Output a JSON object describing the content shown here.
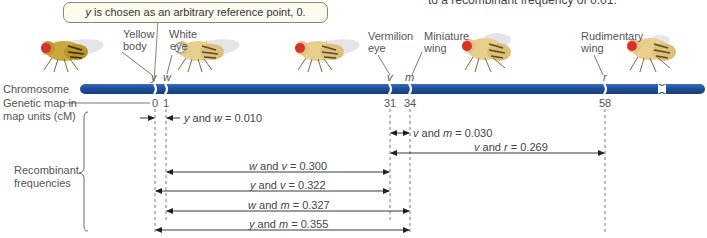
{
  "top_note": "to a recombinant frequency of 0.01.",
  "callout": {
    "gene": "y",
    "text": " is chosen as an arbitrary reference point, 0."
  },
  "row_labels": {
    "chromosome": "Chromosome",
    "genetic_map_line1": "Genetic map in",
    "genetic_map_line2": "map units (cM)",
    "recombinant_line1": "Recombinant",
    "recombinant_line2": "frequencies"
  },
  "genes": [
    {
      "symbol": "y",
      "name_line1": "Yellow",
      "name_line2": "body",
      "map_units": "0",
      "x": 155
    },
    {
      "symbol": "w",
      "name_line1": "White",
      "name_line2": "eye",
      "map_units": "1",
      "x": 166
    },
    {
      "symbol": "v",
      "name_line1": "Vermilion",
      "name_line2": "eye",
      "map_units": "31",
      "x": 390
    },
    {
      "symbol": "m",
      "name_line1": "Miniature",
      "name_line2": "wing",
      "map_units": "34",
      "x": 410
    },
    {
      "symbol": "r",
      "name_line1": "Rudimentary",
      "name_line2": "wing",
      "map_units": "58",
      "x": 605
    }
  ],
  "recombinant_frequencies": [
    {
      "a": "y",
      "b": "w",
      "value": "0.010"
    },
    {
      "a": "v",
      "b": "m",
      "value": "0.030"
    },
    {
      "a": "v",
      "b": "r",
      "value": "0.269"
    },
    {
      "a": "w",
      "b": "v",
      "value": "0.300"
    },
    {
      "a": "y",
      "b": "v",
      "value": "0.322"
    },
    {
      "a": "w",
      "b": "m",
      "value": "0.327"
    },
    {
      "a": "y",
      "b": "m",
      "value": "0.355"
    }
  ],
  "and_word": "and",
  "equals": "=",
  "colors": {
    "chromosome": "#1f4f9a",
    "chromosome_highlight": "#3a6cb8",
    "fly_body_yellow": "#c9a93a",
    "fly_body_wild": "#e8cf8e",
    "fly_eye_red": "#d8322a",
    "fly_eye_white": "#f4f4f4",
    "text": "#4a4a4a"
  }
}
